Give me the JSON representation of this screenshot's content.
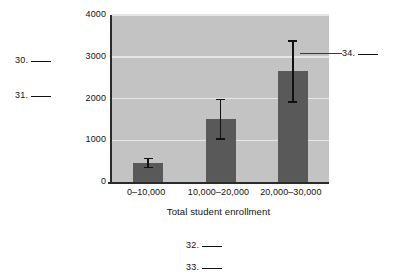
{
  "chart_data": {
    "type": "bar",
    "title": "",
    "xlabel": "Total student enrollment",
    "ylabel": "Freshman enrollment",
    "categories": [
      "0–10,000",
      "10,000–20,000",
      "20,000–30,000"
    ],
    "values": [
      450,
      1500,
      2650
    ],
    "errors_low": [
      330,
      1010,
      1900
    ],
    "errors_high": [
      580,
      2000,
      3400
    ],
    "yticks": [
      0,
      1000,
      2000,
      3000,
      4000
    ],
    "ytick_labels": [
      "0",
      "1000",
      "2000",
      "3000",
      "4000"
    ],
    "ylim": [
      0,
      4000
    ],
    "grid": true,
    "legend": "none",
    "bar_color": "#595959",
    "plot_background": "#c3c3c3",
    "gridline_color": "#e6e6e6",
    "axis_color": "#2b2b2b",
    "errorbar_color": "#111111"
  },
  "annotations": [
    {
      "id": "30",
      "number": "30.",
      "blank": ""
    },
    {
      "id": "31",
      "number": "31.",
      "blank": ""
    },
    {
      "id": "32",
      "number": "32.",
      "blank": ""
    },
    {
      "id": "33",
      "number": "33.",
      "blank": ""
    },
    {
      "id": "34",
      "number": "34.",
      "blank": ""
    }
  ]
}
